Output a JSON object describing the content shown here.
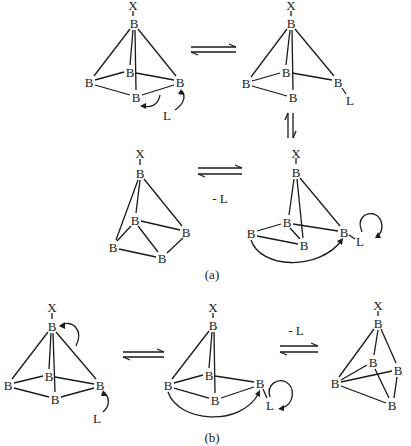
{
  "diagram": {
    "type": "chemical-reaction-scheme",
    "panels": [
      {
        "label": "(a)",
        "label_pos": [
          212,
          274
        ]
      },
      {
        "label": "(b)",
        "label_pos": [
          212,
          437
        ]
      }
    ],
    "reagent_labels": {
      "a_minus_L": "- L",
      "b_minus_L": "- L"
    },
    "atom_symbols": {
      "boron": "B",
      "substituent": "X",
      "ligand": "L"
    },
    "structures": [
      {
        "id": "s1",
        "atoms": [
          {
            "id": "X",
            "sym": "X",
            "x": 133,
            "y": 5
          },
          {
            "id": "Bt",
            "sym": "B",
            "x": 134,
            "y": 23
          },
          {
            "id": "Bb",
            "sym": "B",
            "x": 130,
            "y": 72
          },
          {
            "id": "Bl",
            "sym": "B",
            "x": 89,
            "y": 82
          },
          {
            "id": "Br",
            "sym": "B",
            "x": 180,
            "y": 82
          },
          {
            "id": "Bf",
            "sym": "B",
            "x": 136,
            "y": 97
          },
          {
            "id": "L",
            "sym": "L",
            "x": 167,
            "y": 115
          }
        ]
      },
      {
        "id": "s2",
        "atoms": [
          {
            "id": "X",
            "sym": "X",
            "x": 291,
            "y": 5
          },
          {
            "id": "Bt",
            "sym": "B",
            "x": 291,
            "y": 23
          },
          {
            "id": "Bb",
            "sym": "B",
            "x": 286,
            "y": 72
          },
          {
            "id": "Bl",
            "sym": "B",
            "x": 246,
            "y": 83
          },
          {
            "id": "Br",
            "sym": "B",
            "x": 338,
            "y": 82
          },
          {
            "id": "Bf",
            "sym": "B",
            "x": 293,
            "y": 97
          },
          {
            "id": "L",
            "sym": "L",
            "x": 350,
            "y": 100
          }
        ]
      },
      {
        "id": "s3",
        "atoms": [
          {
            "id": "X",
            "sym": "X",
            "x": 140,
            "y": 153
          },
          {
            "id": "Bt",
            "sym": "B",
            "x": 140,
            "y": 173
          },
          {
            "id": "Bm",
            "sym": "B",
            "x": 135,
            "y": 220
          },
          {
            "id": "Br",
            "sym": "B",
            "x": 186,
            "y": 232
          },
          {
            "id": "Bl",
            "sym": "B",
            "x": 113,
            "y": 247
          },
          {
            "id": "Bb",
            "sym": "B",
            "x": 162,
            "y": 258
          }
        ]
      },
      {
        "id": "s4",
        "atoms": [
          {
            "id": "X",
            "sym": "X",
            "x": 296,
            "y": 153
          },
          {
            "id": "Bt",
            "sym": "B",
            "x": 296,
            "y": 172
          },
          {
            "id": "Bb",
            "sym": "B",
            "x": 287,
            "y": 222
          },
          {
            "id": "Bl",
            "sym": "B",
            "x": 251,
            "y": 233
          },
          {
            "id": "Br",
            "sym": "B",
            "x": 344,
            "y": 232
          },
          {
            "id": "Bf",
            "sym": "B",
            "x": 304,
            "y": 245
          },
          {
            "id": "L",
            "sym": "L",
            "x": 360,
            "y": 241
          }
        ]
      },
      {
        "id": "s5",
        "atoms": [
          {
            "id": "X",
            "sym": "X",
            "x": 52,
            "y": 307
          },
          {
            "id": "Bt",
            "sym": "B",
            "x": 52,
            "y": 326
          },
          {
            "id": "Bb",
            "sym": "B",
            "x": 49,
            "y": 376
          },
          {
            "id": "Bl",
            "sym": "B",
            "x": 8,
            "y": 385
          },
          {
            "id": "Br",
            "sym": "B",
            "x": 100,
            "y": 385
          },
          {
            "id": "Bf",
            "sym": "B",
            "x": 55,
            "y": 399
          },
          {
            "id": "L",
            "sym": "L",
            "x": 97,
            "y": 418
          }
        ]
      },
      {
        "id": "s6",
        "atoms": [
          {
            "id": "X",
            "sym": "X",
            "x": 213,
            "y": 307
          },
          {
            "id": "Bt",
            "sym": "B",
            "x": 213,
            "y": 325
          },
          {
            "id": "Bb",
            "sym": "B",
            "x": 209,
            "y": 375
          },
          {
            "id": "Bl",
            "sym": "B",
            "x": 168,
            "y": 385
          },
          {
            "id": "Br",
            "sym": "B",
            "x": 260,
            "y": 383
          },
          {
            "id": "Bf",
            "sym": "B",
            "x": 215,
            "y": 400
          },
          {
            "id": "L",
            "sym": "L",
            "x": 270,
            "y": 405
          }
        ]
      },
      {
        "id": "s7",
        "atoms": [
          {
            "id": "X",
            "sym": "X",
            "x": 378,
            "y": 305
          },
          {
            "id": "Bt",
            "sym": "B",
            "x": 378,
            "y": 323
          },
          {
            "id": "Bm",
            "sym": "B",
            "x": 373,
            "y": 362
          },
          {
            "id": "Br",
            "sym": "B",
            "x": 398,
            "y": 370
          },
          {
            "id": "Bl",
            "sym": "B",
            "x": 335,
            "y": 383
          },
          {
            "id": "Bb",
            "sym": "B",
            "x": 392,
            "y": 405
          }
        ]
      }
    ],
    "equilibria": [
      {
        "from": "s1",
        "to": "s2",
        "orientation": "horizontal"
      },
      {
        "from": "s2",
        "to": "s4",
        "orientation": "vertical"
      },
      {
        "from": "s4",
        "to": "s3",
        "orientation": "horizontal",
        "label": "- L"
      },
      {
        "from": "s5",
        "to": "s6",
        "orientation": "horizontal"
      },
      {
        "from": "s6",
        "to": "s7",
        "orientation": "horizontal",
        "label": "- L"
      }
    ]
  }
}
